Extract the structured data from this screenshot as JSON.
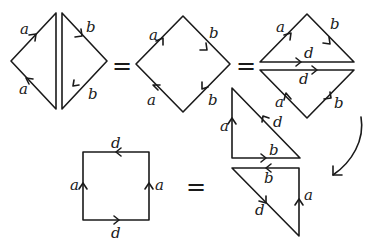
{
  "diagram": {
    "colors": {
      "stroke": "#1a1a1a",
      "background": "#ffffff"
    },
    "equals_sign": "=",
    "figure1": {
      "name": "two-split-triangles",
      "labels": {
        "left_top": "a",
        "left_bottom": "a",
        "right_top": "b",
        "right_bottom": "b"
      }
    },
    "figure2": {
      "name": "diamond",
      "labels": {
        "top_left": "a",
        "bottom_left": "a",
        "top_right": "b",
        "bottom_right": "b"
      }
    },
    "figure3": {
      "name": "diamond-cut-along-d",
      "labels": {
        "top_left": "a",
        "top_right": "b",
        "upper_cut": "d",
        "lower_cut": "d",
        "bottom_left": "a",
        "bottom_right": "b"
      }
    },
    "figure4": {
      "name": "two-right-triangles",
      "upper": {
        "left": "a",
        "hypotenuse": "d",
        "base": "b"
      },
      "lower": {
        "top": "b",
        "hypotenuse": "d",
        "right": "a"
      }
    },
    "figure5": {
      "name": "square",
      "labels": {
        "top": "d",
        "bottom": "d",
        "left": "a",
        "right": "a"
      }
    },
    "curved_arrow": "rotate-flip-arrow"
  }
}
